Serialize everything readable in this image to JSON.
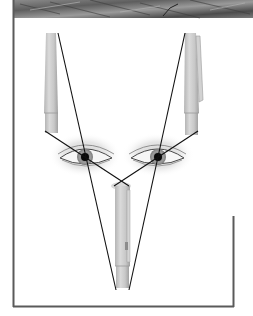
{
  "figure": {
    "elements": {
      "header_band": "textured-stone-strip",
      "pens": [
        "left-pen",
        "right-pen",
        "bottom-pen"
      ],
      "eyes": [
        "left-eye",
        "right-eye"
      ],
      "sight_lines": 4
    },
    "colors": {
      "frame": "#5a5a5a",
      "line": "#111111",
      "pen_body": "#c9c9c9",
      "pen_shade": "#a8a8a8",
      "pupil": "#0a0a0a",
      "header_dark": "#4a4a4a",
      "header_light": "#9a9a9a"
    }
  }
}
